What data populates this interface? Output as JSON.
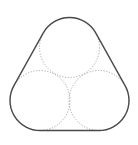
{
  "diagram": {
    "colors": {
      "hull_stroke": "#4a4a4a",
      "circle_stroke": "#a8a8a8",
      "background": "#ffffff"
    },
    "circles": [
      {
        "name": "top",
        "cx": 69.5,
        "cy": 47.5,
        "r": 30
      },
      {
        "name": "bottom-left",
        "cx": 40,
        "cy": 100.5,
        "r": 30
      },
      {
        "name": "bottom-right",
        "cx": 99,
        "cy": 100.5,
        "r": 30
      }
    ],
    "hull": {
      "shape": "rounded-triangle",
      "path": "M 40,130.5 L 99,130.5 A 30 30 0 0 0 125.2,85.9 L 95.7,32.9 A 30 30 0 0 0 43.3,32.9 L 13.8,85.9 A 30 30 0 0 0 40,130.5 Z"
    }
  }
}
